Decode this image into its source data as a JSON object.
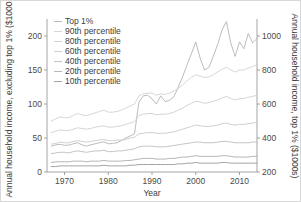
{
  "chart_data": {
    "type": "line",
    "title": "",
    "xlabel": "Year",
    "ylabel_left": "Annual household income, excluding top 1% ($1000s)",
    "ylabel_right": "Annual household income, top 1% ($1000s)",
    "xlim": [
      1966,
      2014
    ],
    "ylim_left": [
      0,
      225
    ],
    "ylim_right": [
      200,
      1100
    ],
    "xticks": [
      1970,
      1980,
      1990,
      2000,
      2010
    ],
    "yticks_left": [
      0,
      50,
      100,
      150,
      200
    ],
    "yticks_right": [
      200,
      400,
      600,
      800,
      1000
    ],
    "grid": false,
    "legend_position": "top-left",
    "x": [
      1967,
      1968,
      1969,
      1970,
      1971,
      1972,
      1973,
      1974,
      1975,
      1976,
      1977,
      1978,
      1979,
      1980,
      1981,
      1982,
      1983,
      1984,
      1985,
      1986,
      1987,
      1988,
      1989,
      1990,
      1991,
      1992,
      1993,
      1994,
      1995,
      1996,
      1997,
      1998,
      1999,
      2000,
      2001,
      2002,
      2003,
      2004,
      2005,
      2006,
      2007,
      2008,
      2009,
      2010,
      2011,
      2012,
      2013,
      2014
    ],
    "series": [
      {
        "name": "Top 1%",
        "axis": "right",
        "color": "#b4b4b4",
        "values": [
          352,
          360,
          363,
          357,
          358,
          366,
          372,
          360,
          352,
          360,
          366,
          372,
          378,
          366,
          368,
          372,
          385,
          400,
          412,
          425,
          610,
          648,
          652,
          630,
          600,
          648,
          614,
          622,
          642,
          700,
          760,
          830,
          895,
          965,
          870,
          800,
          815,
          880,
          950,
          1035,
          1085,
          960,
          880,
          965,
          925,
          1015,
          960,
          985
        ]
      },
      {
        "name": "90th percentile",
        "axis": "left",
        "color": "#d2d2d2",
        "values": [
          75,
          78,
          81,
          80,
          80,
          83,
          86,
          84,
          83,
          85,
          87,
          89,
          91,
          88,
          88,
          89,
          91,
          94,
          97,
          100,
          112,
          115,
          116,
          116,
          113,
          115,
          114,
          116,
          119,
          123,
          128,
          134,
          139,
          143,
          141,
          139,
          140,
          143,
          147,
          151,
          154,
          150,
          147,
          150,
          150,
          153,
          155,
          158
        ]
      },
      {
        "name": "80th percentile",
        "axis": "left",
        "color": "#cfcfcf",
        "values": [
          58,
          60,
          62,
          61,
          61,
          63,
          65,
          64,
          63,
          64,
          66,
          67,
          68,
          66,
          66,
          67,
          68,
          70,
          72,
          74,
          83,
          85,
          86,
          86,
          84,
          85,
          85,
          86,
          88,
          91,
          94,
          98,
          101,
          104,
          103,
          101,
          102,
          104,
          106,
          109,
          111,
          108,
          106,
          108,
          108,
          110,
          111,
          113
        ]
      },
      {
        "name": "60th percentile",
        "axis": "left",
        "color": "#c9c9c9",
        "values": [
          41,
          42,
          44,
          43,
          43,
          45,
          46,
          45,
          44,
          45,
          46,
          47,
          48,
          46,
          46,
          47,
          47,
          48,
          50,
          51,
          56,
          57,
          58,
          58,
          57,
          57,
          57,
          58,
          59,
          61,
          63,
          65,
          67,
          69,
          68,
          67,
          67,
          68,
          69,
          71,
          72,
          70,
          69,
          70,
          70,
          71,
          72,
          73
        ]
      },
      {
        "name": "40th percentile",
        "axis": "left",
        "color": "#bdbdbd",
        "values": [
          27,
          28,
          29,
          29,
          28,
          30,
          31,
          30,
          29,
          30,
          31,
          31,
          32,
          30,
          30,
          31,
          31,
          32,
          33,
          34,
          37,
          38,
          38,
          38,
          37,
          37,
          37,
          38,
          39,
          40,
          41,
          42,
          43,
          44,
          44,
          43,
          43,
          43,
          44,
          45,
          45,
          44,
          43,
          43,
          43,
          43,
          44,
          44
        ]
      },
      {
        "name": "20th percentile",
        "axis": "left",
        "color": "#aeaeae",
        "values": [
          14,
          15,
          15,
          15,
          15,
          16,
          16,
          16,
          15,
          16,
          16,
          16,
          17,
          16,
          16,
          16,
          16,
          17,
          17,
          18,
          19,
          20,
          20,
          20,
          19,
          19,
          19,
          20,
          20,
          21,
          22,
          22,
          23,
          24,
          23,
          23,
          23,
          23,
          23,
          24,
          24,
          23,
          22,
          22,
          22,
          22,
          23,
          23
        ]
      },
      {
        "name": "10th percentile",
        "axis": "left",
        "color": "#9a9a9a",
        "values": [
          8,
          8,
          9,
          9,
          9,
          9,
          9,
          9,
          9,
          9,
          9,
          9,
          10,
          9,
          9,
          9,
          9,
          9,
          10,
          10,
          11,
          11,
          11,
          11,
          11,
          11,
          11,
          11,
          11,
          12,
          12,
          13,
          13,
          14,
          13,
          13,
          13,
          13,
          13,
          14,
          14,
          13,
          13,
          13,
          13,
          13,
          13,
          13
        ]
      }
    ],
    "legend": [
      {
        "label": "Top 1%",
        "color": "#b4b4b4"
      },
      {
        "label": "90th percentile",
        "color": "#d2d2d2"
      },
      {
        "label": "80th percentile",
        "color": "#cfcfcf"
      },
      {
        "label": "60th percentile",
        "color": "#c9c9c9"
      },
      {
        "label": "40th percentile",
        "color": "#bdbdbd"
      },
      {
        "label": "20th percentile",
        "color": "#aeaeae"
      },
      {
        "label": "10th percentile",
        "color": "#9a9a9a"
      }
    ]
  }
}
